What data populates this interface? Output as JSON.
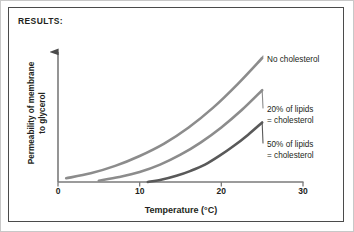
{
  "figure": {
    "title": "RESULTS:",
    "border_color": "#4b4b4b",
    "background": "#ffffff"
  },
  "chart_data": {
    "type": "line",
    "title": "RESULTS:",
    "xlabel": "Temperature (°C)",
    "ylabel_line1": "Permeability of membrane",
    "ylabel_line2": "to glycerol",
    "xlim": [
      0,
      30
    ],
    "ylim": [
      0,
      100
    ],
    "xticks": [
      0,
      10,
      20,
      30
    ],
    "xtick_labels": [
      "0",
      "10",
      "20",
      "30"
    ],
    "yticks": [],
    "ytick_labels": [],
    "grid": false,
    "legend_position": "inline-right",
    "axis_style": "y-axis-arrow",
    "series": [
      {
        "name": "No cholesterol",
        "label_line1": "No cholesterol",
        "label_line2": "",
        "color": "#8c8c8c",
        "linewidth": 2.6,
        "x": [
          1,
          4,
          7,
          10,
          13,
          16,
          19,
          22,
          25
        ],
        "y": [
          3,
          7,
          13,
          21,
          31,
          44,
          60,
          79,
          100
        ]
      },
      {
        "name": "20% of lipids = cholesterol",
        "label_line1": "20% of lipids",
        "label_line2": "= cholesterol",
        "color": "#8c8c8c",
        "linewidth": 2.6,
        "x": [
          5,
          7.5,
          10,
          12.5,
          15,
          17.5,
          20,
          22.5,
          25
        ],
        "y": [
          1,
          4,
          8,
          14,
          22,
          32,
          44,
          58,
          74
        ]
      },
      {
        "name": "50% of lipids = cholesterol",
        "label_line1": "50% of lipids",
        "label_line2": "= cholesterol",
        "color": "#595959",
        "linewidth": 2.6,
        "x": [
          11,
          12.75,
          14.5,
          16.25,
          18,
          19.75,
          21.5,
          23.25,
          25
        ],
        "y": [
          0,
          2,
          5,
          9,
          14,
          21,
          29,
          38,
          48
        ]
      }
    ]
  },
  "axis": {
    "color": "#6e6e6e",
    "x_start_px": 58,
    "x_end_px": 303,
    "baseline_px": 182,
    "y_top_px": 45
  }
}
